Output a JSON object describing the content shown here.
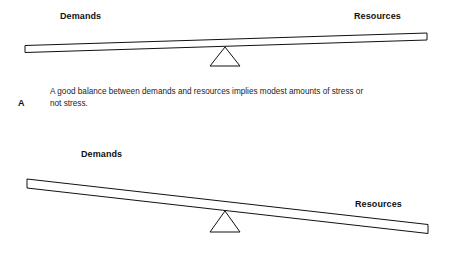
{
  "figure": {
    "type": "diagram",
    "background_color": "#ffffff",
    "stroke_color": "#111111"
  },
  "panels": [
    {
      "letter": "A",
      "caption": "A good balance between demands and resources implies modest amounts of stress or not stress.",
      "left_label": "Demands",
      "right_label": "Resources",
      "state": "balanced"
    },
    {
      "letter": "",
      "caption": "",
      "left_label": "Demands",
      "right_label": "Resources",
      "state": "tilted-right"
    }
  ],
  "seesaw_a": {
    "beam": {
      "left_top": [
        25,
        45.5
      ],
      "left_bottom": [
        25,
        52.5
      ],
      "right_top": [
        427,
        33
      ],
      "right_bottom": [
        427,
        40
      ]
    },
    "fulcrum": {
      "apex": [
        225,
        47
      ],
      "base_left": [
        210,
        66
      ],
      "base_right": [
        240,
        66
      ]
    }
  },
  "seesaw_b": {
    "beam": {
      "left_top": [
        27,
        179
      ],
      "left_bottom": [
        27,
        188
      ],
      "right_top": [
        428,
        224.5
      ],
      "right_bottom": [
        428,
        233.5
      ]
    },
    "fulcrum": {
      "apex": [
        225,
        211
      ],
      "base_left": [
        210,
        232
      ],
      "base_right": [
        240,
        232
      ]
    }
  }
}
